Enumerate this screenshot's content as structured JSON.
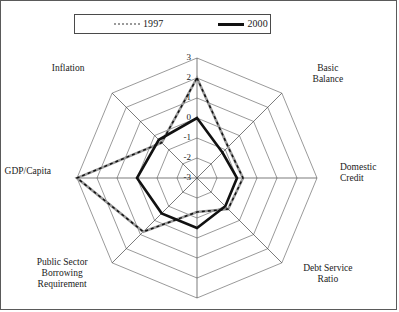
{
  "figure": {
    "border_color": "#5a5a5a",
    "background": "#ffffff"
  },
  "legend": {
    "entries": [
      {
        "label": "1997",
        "color": "#9a9a9a",
        "style": "dotted-thin",
        "icon": "line-swatch-icon"
      },
      {
        "label": "2000",
        "color": "#111111",
        "style": "solid-thick",
        "icon": "line-swatch-icon"
      }
    ]
  },
  "chart_data": {
    "type": "line",
    "subtype": "radar",
    "title": "",
    "categories": [
      "Refinancing Risk",
      "Basic Balance",
      "Domestic Credit",
      "Debt Service Ratio",
      "External Debt/GDP",
      "Public Sector Borrowing Requirement",
      "GDP/Capita",
      "Inflation"
    ],
    "category_display": [
      "Refinancing Risk",
      "Basic\nBalance",
      "Domestic\nCredit",
      "Debt Service\nRatio",
      "External Debt/GDP",
      "Public Sector\nBorrowing\nRequirement",
      "GDP/Capita",
      "Inflation"
    ],
    "tick_labels": [
      "3",
      "2",
      "1",
      "0",
      "-1",
      "-2",
      "-3"
    ],
    "rlim": [
      -3,
      3
    ],
    "rticks": [
      -3,
      -2,
      -1,
      0,
      1,
      2,
      3
    ],
    "grid": true,
    "grid_shape": "polygon",
    "legend_position": "top",
    "xlabel": "",
    "ylabel": "",
    "series": [
      {
        "name": "1997",
        "color": "#9a9a9a",
        "style": "dotted-thin",
        "values": [
          2.0,
          -0.8,
          -0.7,
          -0.8,
          -1.3,
          0.8,
          3.0,
          -0.5
        ]
      },
      {
        "name": "2000",
        "color": "#111111",
        "style": "solid-thick",
        "values": [
          0.0,
          -1.2,
          -1.0,
          -1.0,
          -0.5,
          -0.5,
          0.0,
          -0.3
        ]
      }
    ]
  }
}
